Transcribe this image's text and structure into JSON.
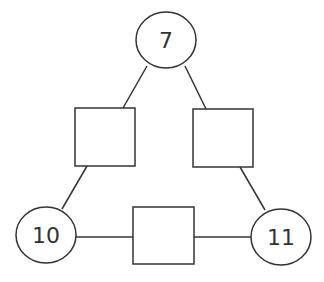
{
  "diagram": {
    "type": "number-triangle",
    "stroke_color": "#333333",
    "circles": [
      {
        "id": "top",
        "label": "7"
      },
      {
        "id": "bottom-left",
        "label": "10"
      },
      {
        "id": "bottom-right",
        "label": "11"
      }
    ],
    "boxes": [
      {
        "id": "left-side",
        "label": ""
      },
      {
        "id": "right-side",
        "label": ""
      },
      {
        "id": "bottom-side",
        "label": ""
      }
    ]
  }
}
